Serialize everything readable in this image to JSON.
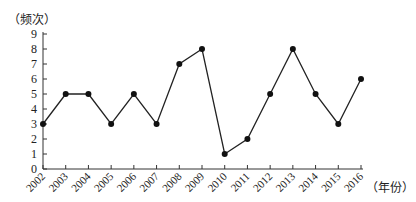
{
  "chart_data": {
    "type": "line",
    "title": "",
    "xlabel": "（年份）",
    "ylabel": "（频次）",
    "categories": [
      "2002",
      "2003",
      "2004",
      "2005",
      "2006",
      "2007",
      "2008",
      "2009",
      "2010",
      "2011",
      "2012",
      "2013",
      "2014",
      "2015",
      "2016"
    ],
    "series": [
      {
        "name": "频次",
        "values": [
          3,
          5,
          5,
          3,
          5,
          3,
          7,
          8,
          1,
          2,
          5,
          8,
          5,
          3,
          6
        ]
      }
    ],
    "ylim": [
      0,
      9
    ],
    "yticks": [
      0,
      1,
      2,
      3,
      4,
      5,
      6,
      7,
      8,
      9
    ],
    "grid": false,
    "legend": "none",
    "marker": "circle",
    "line_color": "#222222"
  }
}
